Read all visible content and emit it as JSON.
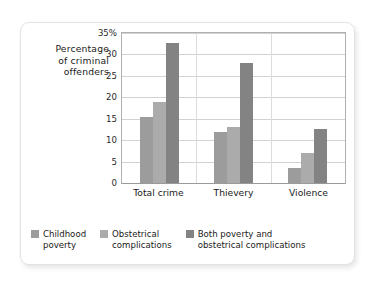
{
  "chart_data": {
    "type": "bar",
    "title": "",
    "xlabel": "",
    "ylabel": "Percentage of criminal offenders",
    "ylabel_lines": [
      "Percentage",
      "of criminal",
      "offenders"
    ],
    "categories": [
      "Total crime",
      "Thievery",
      "Violence"
    ],
    "series": [
      {
        "name": "Childhood poverty",
        "color": "#9c9c9c",
        "values": [
          15.3,
          12.0,
          3.5
        ]
      },
      {
        "name": "Obstetrical complications",
        "color": "#ababab",
        "values": [
          18.8,
          13.0,
          7.0
        ]
      },
      {
        "name": "Both poverty and obstetrical complications",
        "color": "#838383",
        "values": [
          32.7,
          28.0,
          12.5
        ]
      }
    ],
    "ylim": [
      0,
      35
    ],
    "yticks": [
      0,
      5,
      10,
      15,
      20,
      25,
      30,
      35
    ],
    "ytick_labels": [
      "0",
      "5",
      "10",
      "15",
      "20",
      "25",
      "30",
      "35%"
    ],
    "grid": true,
    "legend_position": "bottom"
  },
  "legend": {
    "items": [
      {
        "lines": [
          "Childhood",
          "poverty"
        ],
        "color": "#9c9c9c"
      },
      {
        "lines": [
          "Obstetrical",
          "complications"
        ],
        "color": "#ababab"
      },
      {
        "lines": [
          "Both poverty and",
          "obstetrical complications"
        ],
        "color": "#838383"
      }
    ]
  },
  "colors": {
    "card_border": "#e3e3e3",
    "plot_border": "#b0b0b0",
    "gridline": "#d2d2d2",
    "axis": "#9a9a9a",
    "text": "#1a1a1a"
  }
}
